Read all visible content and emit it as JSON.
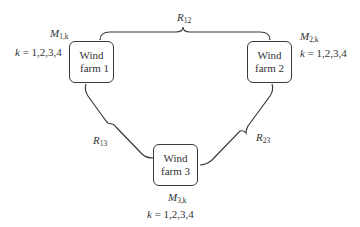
{
  "nodes": [
    {
      "id": "wf1",
      "line1": "Wind",
      "line2": "farm 1",
      "model_var": "M",
      "model_sub": "1,k",
      "k_label": "k",
      "k_values": "= 1,2,3,4"
    },
    {
      "id": "wf2",
      "line1": "Wind",
      "line2": "farm 2",
      "model_var": "M",
      "model_sub": "2,k",
      "k_label": "k",
      "k_values": "= 1,2,3,4"
    },
    {
      "id": "wf3",
      "line1": "Wind",
      "line2": "farm 3",
      "model_var": "M",
      "model_sub": "3,k",
      "k_label": "k",
      "k_values": "= 1,2,3,4"
    }
  ],
  "links": [
    {
      "id": "r12",
      "var": "R",
      "sub": "12",
      "from": "wf1",
      "to": "wf2"
    },
    {
      "id": "r13",
      "var": "R",
      "sub": "13",
      "from": "wf1",
      "to": "wf3"
    },
    {
      "id": "r23",
      "var": "R",
      "sub": "23",
      "from": "wf2",
      "to": "wf3"
    }
  ],
  "colors": {
    "stroke": "#3a3a3a",
    "text": "#333333",
    "background": "#ffffff"
  }
}
